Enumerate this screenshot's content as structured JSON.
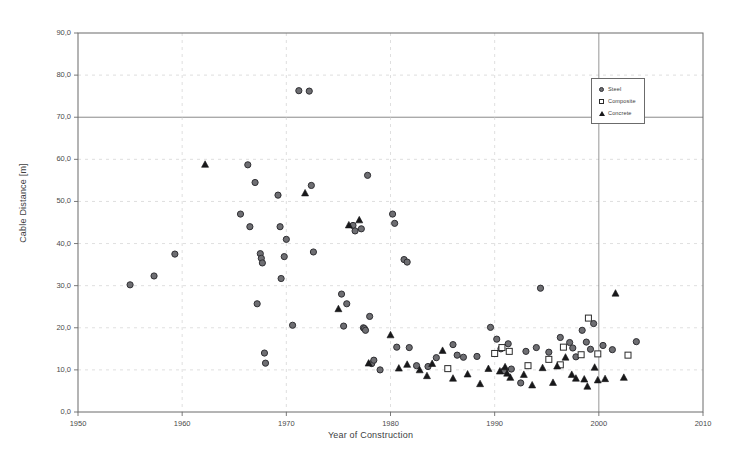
{
  "chart_data": {
    "type": "scatter",
    "title": "",
    "xlabel": "Year of Construction",
    "ylabel": "Cable Distance [m]",
    "xlim": [
      1950,
      2010
    ],
    "ylim": [
      0,
      90
    ],
    "xticks": [
      "1950",
      "1960",
      "1970",
      "1980",
      "1990",
      "2000",
      "2010"
    ],
    "xtick_values": [
      1950,
      1960,
      1970,
      1980,
      1990,
      2000,
      2010
    ],
    "yticks": [
      "0,0",
      "10,0",
      "20,0",
      "30,0",
      "40,0",
      "50,0",
      "60,0",
      "70,0",
      "80,0",
      "90,0"
    ],
    "ytick_values": [
      0,
      10,
      20,
      30,
      40,
      50,
      60,
      70,
      80,
      90
    ],
    "grid": true,
    "grid_color": "#c9c9c9",
    "frame_color": "#6b6b6b",
    "legend_position": "top-right",
    "series": [
      {
        "name": "Steel",
        "marker": "filled-circle",
        "color": "#6e6e72",
        "edge_color": "#2f2f33",
        "points": [
          [
            1955.0,
            30.2
          ],
          [
            1957.3,
            32.3
          ],
          [
            1959.3,
            37.5
          ],
          [
            1965.6,
            47.0
          ],
          [
            1966.3,
            58.7
          ],
          [
            1966.5,
            44.0
          ],
          [
            1967.0,
            54.5
          ],
          [
            1967.2,
            25.7
          ],
          [
            1967.5,
            37.6
          ],
          [
            1967.6,
            36.5
          ],
          [
            1967.7,
            35.4
          ],
          [
            1967.9,
            14.0
          ],
          [
            1968.0,
            11.6
          ],
          [
            1969.2,
            51.5
          ],
          [
            1969.4,
            44.0
          ],
          [
            1969.5,
            31.7
          ],
          [
            1969.8,
            36.9
          ],
          [
            1970.0,
            41.0
          ],
          [
            1970.6,
            20.6
          ],
          [
            1971.2,
            76.3
          ],
          [
            1972.2,
            76.2
          ],
          [
            1972.4,
            53.8
          ],
          [
            1972.6,
            38.0
          ],
          [
            1975.3,
            28.0
          ],
          [
            1975.5,
            20.4
          ],
          [
            1975.8,
            25.7
          ],
          [
            1976.4,
            44.3
          ],
          [
            1976.6,
            43.0
          ],
          [
            1977.2,
            43.5
          ],
          [
            1977.4,
            20.0
          ],
          [
            1977.5,
            19.8
          ],
          [
            1977.6,
            19.4
          ],
          [
            1977.8,
            56.2
          ],
          [
            1978.0,
            22.7
          ],
          [
            1978.2,
            11.5
          ],
          [
            1978.4,
            12.3
          ],
          [
            1979.0,
            10.0
          ],
          [
            1980.2,
            47.0
          ],
          [
            1980.4,
            44.8
          ],
          [
            1980.6,
            15.4
          ],
          [
            1981.3,
            36.2
          ],
          [
            1981.6,
            35.6
          ],
          [
            1981.8,
            15.3
          ],
          [
            1982.5,
            11.0
          ],
          [
            1983.6,
            10.8
          ],
          [
            1984.4,
            12.9
          ],
          [
            1986.0,
            16.0
          ],
          [
            1986.4,
            13.5
          ],
          [
            1987.0,
            13.0
          ],
          [
            1988.3,
            13.2
          ],
          [
            1989.6,
            20.1
          ],
          [
            1990.2,
            17.3
          ],
          [
            1990.6,
            15.0
          ],
          [
            1990.9,
            9.8
          ],
          [
            1991.3,
            16.2
          ],
          [
            1991.6,
            10.2
          ],
          [
            1992.5,
            6.9
          ],
          [
            1993.0,
            14.4
          ],
          [
            1994.0,
            15.3
          ],
          [
            1994.4,
            29.4
          ],
          [
            1995.2,
            14.2
          ],
          [
            1996.3,
            17.7
          ],
          [
            1997.2,
            16.5
          ],
          [
            1997.5,
            15.2
          ],
          [
            1997.8,
            13.1
          ],
          [
            1998.4,
            19.4
          ],
          [
            1998.8,
            16.6
          ],
          [
            1999.2,
            14.9
          ],
          [
            1999.5,
            21.0
          ],
          [
            2000.4,
            15.8
          ],
          [
            2001.3,
            14.8
          ],
          [
            2003.6,
            16.7
          ]
        ]
      },
      {
        "name": "Composite",
        "marker": "open-square",
        "color": "#ffffff",
        "edge_color": "#2b2b2b",
        "points": [
          [
            1985.5,
            10.3
          ],
          [
            1990.0,
            13.9
          ],
          [
            1990.7,
            15.3
          ],
          [
            1991.4,
            14.4
          ],
          [
            1993.2,
            11.0
          ],
          [
            1995.2,
            12.5
          ],
          [
            1996.3,
            11.2
          ],
          [
            1996.6,
            15.4
          ],
          [
            1998.3,
            13.6
          ],
          [
            1999.0,
            22.3
          ],
          [
            1999.9,
            13.8
          ],
          [
            2002.8,
            13.5
          ]
        ]
      },
      {
        "name": "Concrete",
        "marker": "filled-triangle",
        "color": "#18181a",
        "edge_color": "#18181a",
        "points": [
          [
            1962.2,
            58.8
          ],
          [
            1971.8,
            52.0
          ],
          [
            1975.0,
            24.5
          ],
          [
            1976.0,
            44.4
          ],
          [
            1977.0,
            45.6
          ],
          [
            1977.9,
            11.6
          ],
          [
            1980.0,
            18.3
          ],
          [
            1980.8,
            10.4
          ],
          [
            1981.6,
            11.3
          ],
          [
            1982.8,
            10.0
          ],
          [
            1983.5,
            8.6
          ],
          [
            1984.0,
            11.5
          ],
          [
            1985.0,
            14.6
          ],
          [
            1986.0,
            8.0
          ],
          [
            1987.4,
            9.0
          ],
          [
            1988.6,
            6.7
          ],
          [
            1989.4,
            10.3
          ],
          [
            1990.5,
            9.7
          ],
          [
            1991.0,
            10.7
          ],
          [
            1991.2,
            9.2
          ],
          [
            1991.5,
            8.2
          ],
          [
            1992.8,
            8.9
          ],
          [
            1993.6,
            6.4
          ],
          [
            1994.6,
            10.5
          ],
          [
            1995.6,
            7.0
          ],
          [
            1996.0,
            10.9
          ],
          [
            1996.8,
            13.0
          ],
          [
            1997.4,
            8.9
          ],
          [
            1997.8,
            8.0
          ],
          [
            1998.6,
            7.8
          ],
          [
            1998.9,
            6.1
          ],
          [
            1999.6,
            10.6
          ],
          [
            1999.9,
            7.6
          ],
          [
            2000.6,
            7.9
          ],
          [
            2001.6,
            28.2
          ],
          [
            2002.4,
            8.2
          ]
        ]
      }
    ]
  },
  "legend": {
    "items": [
      {
        "label": "Steel",
        "marker": "filled-circle"
      },
      {
        "label": "Composite",
        "marker": "open-square"
      },
      {
        "label": "Concrete",
        "marker": "filled-triangle"
      }
    ]
  }
}
